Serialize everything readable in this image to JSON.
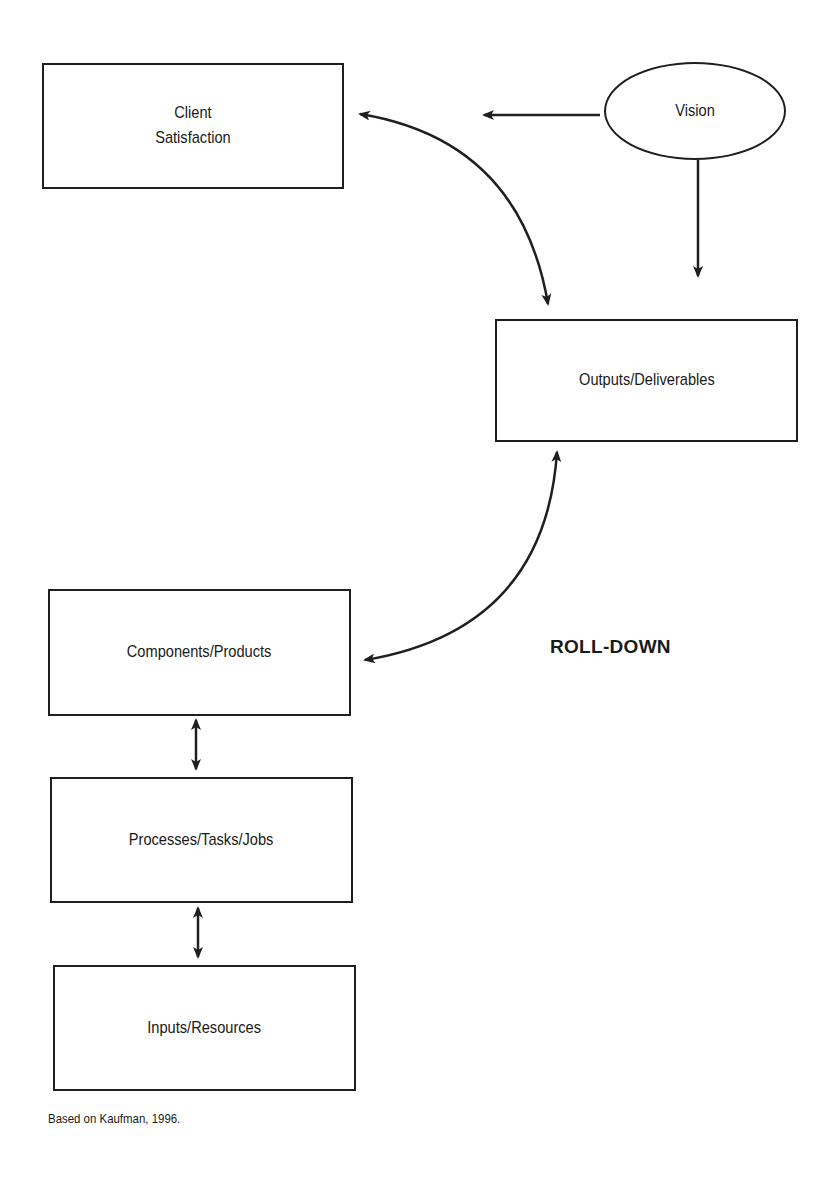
{
  "diagram": {
    "type": "flow",
    "nodes": {
      "client_satisfaction": {
        "label": "Client\nSatisfaction",
        "shape": "rectangle"
      },
      "vision": {
        "label": "Vision",
        "shape": "ellipse"
      },
      "outputs": {
        "label": "Outputs/Deliverables",
        "shape": "rectangle"
      },
      "components": {
        "label": "Components/Products",
        "shape": "rectangle"
      },
      "processes": {
        "label": "Processes/Tasks/Jobs",
        "shape": "rectangle"
      },
      "inputs": {
        "label": "Inputs/Resources",
        "shape": "rectangle"
      }
    },
    "edges": [
      {
        "from": "vision",
        "to": "client_satisfaction",
        "style": "one-way straight"
      },
      {
        "from": "vision",
        "to": "outputs",
        "style": "one-way straight"
      },
      {
        "from": "client_satisfaction",
        "to": "outputs",
        "style": "two-way curved"
      },
      {
        "from": "outputs",
        "to": "components",
        "style": "two-way curved"
      },
      {
        "from": "components",
        "to": "processes",
        "style": "two-way straight"
      },
      {
        "from": "processes",
        "to": "inputs",
        "style": "two-way straight"
      }
    ],
    "annotation": "ROLL-DOWN",
    "footnote": "Based on Kaufman, 1996.",
    "colors": {
      "stroke": "#1f1f1f",
      "background": "#ffffff",
      "text": "#1a1a1a"
    }
  }
}
